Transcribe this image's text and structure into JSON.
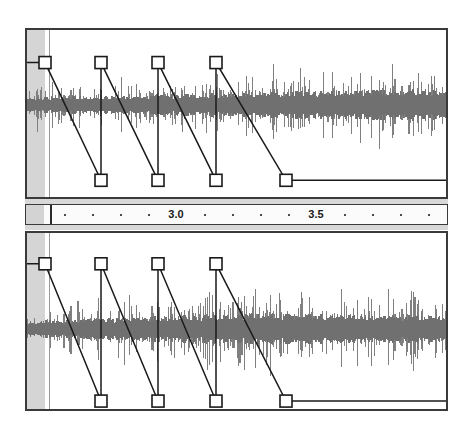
{
  "app": {
    "title": "Audio Editor — Amplitude Envelope",
    "background_color": "#ffffff"
  },
  "colors": {
    "waveform": "#808080",
    "waveform_dark": "#707070",
    "envelope_line": "#1a1a1a",
    "handle_fill": "#ffffff",
    "handle_stroke": "#1a1a1a",
    "panel_border": "#3a3a3a",
    "selection": "#d3d3d3",
    "ruler_band": "#d8d8d8",
    "ruler_face": "#fbfbfb",
    "tick": "#4a4a4a",
    "playhead": "#9a9a9a",
    "cursor": "#2a2a2a"
  },
  "ruler": {
    "name": "timeline-ruler",
    "unit": "seconds",
    "selection_width_px": 18,
    "cursor_x_px": 24,
    "tick_spacing_px": 28,
    "tick_start_px": 38,
    "tick_count": 14,
    "labels": [
      {
        "text": "3.0",
        "x_px": 150
      },
      {
        "text": "3.5",
        "x_px": 290
      }
    ]
  },
  "tracks": [
    {
      "name": "track-1",
      "selection_width_px": 18,
      "playhead_x_px": 22,
      "waveform": {
        "top_px": 30,
        "height_px": 90,
        "baseline_ratio": 0.5,
        "seed": 1207,
        "bars": 300,
        "amplitude_profile": [
          0.38,
          0.42,
          0.36,
          0.44,
          0.4,
          0.46,
          0.42,
          0.48,
          0.44,
          0.5,
          0.47,
          0.52,
          0.5,
          0.56,
          0.53,
          0.58,
          0.56,
          0.62,
          0.6,
          0.66,
          0.63,
          0.68,
          0.66,
          0.7,
          0.68,
          0.72,
          0.7,
          0.74,
          0.72,
          0.7
        ]
      },
      "envelope": {
        "label": "amplitude-envelope",
        "top_ratio": 0.195,
        "bottom_ratio": 0.9,
        "points": [
          {
            "x_px": 18,
            "level": "top"
          },
          {
            "x_px": 74,
            "level": "bottom"
          },
          {
            "x_px": 74,
            "level": "top"
          },
          {
            "x_px": 131,
            "level": "bottom"
          },
          {
            "x_px": 131,
            "level": "top"
          },
          {
            "x_px": 189,
            "level": "bottom"
          },
          {
            "x_px": 189,
            "level": "top"
          },
          {
            "x_px": 259,
            "level": "bottom"
          },
          {
            "x_px": 423,
            "level": "bottom"
          }
        ],
        "handles": [
          {
            "x_px": 18,
            "level": "top",
            "name": "envelope-handle-1"
          },
          {
            "x_px": 74,
            "level": "top",
            "name": "envelope-handle-2"
          },
          {
            "x_px": 131,
            "level": "top",
            "name": "envelope-handle-3"
          },
          {
            "x_px": 189,
            "level": "top",
            "name": "envelope-handle-4"
          },
          {
            "x_px": 74,
            "level": "bottom",
            "name": "envelope-handle-5"
          },
          {
            "x_px": 131,
            "level": "bottom",
            "name": "envelope-handle-6"
          },
          {
            "x_px": 189,
            "level": "bottom",
            "name": "envelope-handle-7"
          },
          {
            "x_px": 259,
            "level": "bottom",
            "name": "envelope-handle-8"
          }
        ]
      }
    },
    {
      "name": "track-2",
      "selection_width_px": 18,
      "playhead_x_px": 22,
      "waveform": {
        "top_px": 48,
        "height_px": 96,
        "baseline_ratio": 0.5,
        "seed": 8831,
        "bars": 300,
        "amplitude_profile": [
          0.34,
          0.4,
          0.36,
          0.44,
          0.42,
          0.5,
          0.46,
          0.54,
          0.5,
          0.58,
          0.54,
          0.62,
          0.58,
          0.66,
          0.62,
          0.7,
          0.66,
          0.72,
          0.68,
          0.7,
          0.66,
          0.68,
          0.64,
          0.66,
          0.62,
          0.64,
          0.6,
          0.62,
          0.58,
          0.56
        ]
      },
      "envelope": {
        "label": "amplitude-envelope",
        "top_ratio": 0.175,
        "bottom_ratio": 0.955,
        "points": [
          {
            "x_px": 18,
            "level": "top"
          },
          {
            "x_px": 74,
            "level": "bottom"
          },
          {
            "x_px": 74,
            "level": "top"
          },
          {
            "x_px": 131,
            "level": "bottom"
          },
          {
            "x_px": 131,
            "level": "top"
          },
          {
            "x_px": 189,
            "level": "bottom"
          },
          {
            "x_px": 189,
            "level": "top"
          },
          {
            "x_px": 259,
            "level": "bottom"
          },
          {
            "x_px": 423,
            "level": "bottom"
          }
        ],
        "handles": [
          {
            "x_px": 18,
            "level": "top",
            "name": "envelope-handle-1"
          },
          {
            "x_px": 74,
            "level": "top",
            "name": "envelope-handle-2"
          },
          {
            "x_px": 131,
            "level": "top",
            "name": "envelope-handle-3"
          },
          {
            "x_px": 189,
            "level": "top",
            "name": "envelope-handle-4"
          },
          {
            "x_px": 74,
            "level": "bottom",
            "name": "envelope-handle-5"
          },
          {
            "x_px": 131,
            "level": "bottom",
            "name": "envelope-handle-6"
          },
          {
            "x_px": 189,
            "level": "bottom",
            "name": "envelope-handle-7"
          },
          {
            "x_px": 259,
            "level": "bottom",
            "name": "envelope-handle-8"
          }
        ]
      }
    }
  ]
}
